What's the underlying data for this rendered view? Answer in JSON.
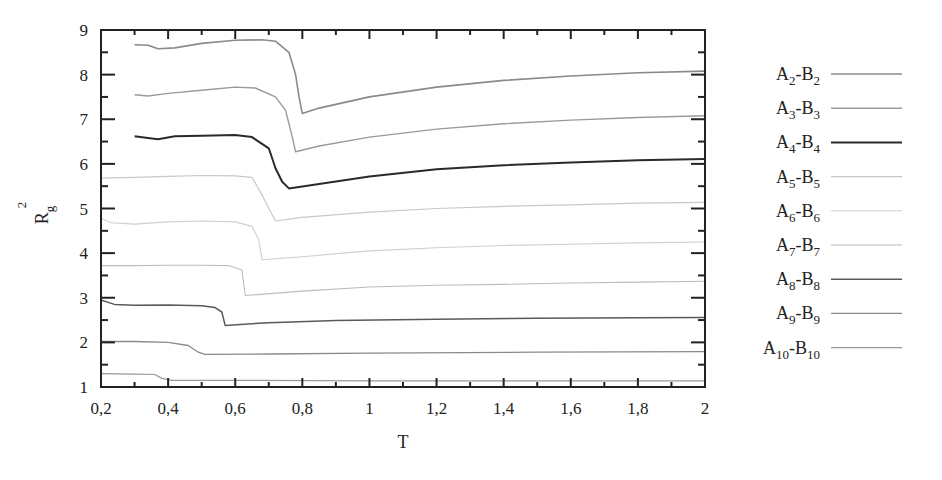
{
  "chart_data": {
    "type": "line",
    "title": "",
    "xlabel": "T",
    "ylabel": "R_g^2",
    "xlim": [
      0.2,
      2.0
    ],
    "ylim": [
      1,
      9
    ],
    "x_ticks": [
      "0,2",
      "0,4",
      "0,6",
      "0,8",
      "1",
      "1,2",
      "1,4",
      "1,6",
      "1,8",
      "2"
    ],
    "y_ticks": [
      "1",
      "2",
      "3",
      "4",
      "5",
      "6",
      "7",
      "8",
      "9"
    ],
    "grid": false,
    "legend_position": "right-outside",
    "series": [
      {
        "name": "A2-B2",
        "label_main": [
          "A",
          "2",
          "-B",
          "2"
        ],
        "color": "#8a8a8a",
        "width": 1.6,
        "points": [
          [
            0.3,
            8.67
          ],
          [
            0.34,
            8.66
          ],
          [
            0.37,
            8.58
          ],
          [
            0.42,
            8.6
          ],
          [
            0.5,
            8.7
          ],
          [
            0.6,
            8.77
          ],
          [
            0.68,
            8.78
          ],
          [
            0.72,
            8.75
          ],
          [
            0.76,
            8.5
          ],
          [
            0.78,
            8.0
          ],
          [
            0.79,
            7.5
          ],
          [
            0.8,
            7.13
          ],
          [
            0.85,
            7.25
          ],
          [
            1.0,
            7.5
          ],
          [
            1.2,
            7.72
          ],
          [
            1.4,
            7.87
          ],
          [
            1.6,
            7.97
          ],
          [
            1.8,
            8.04
          ],
          [
            2.0,
            8.08
          ]
        ]
      },
      {
        "name": "A3-B3",
        "label_main": [
          "A",
          "3",
          "-B",
          "3"
        ],
        "color": "#9a9a9a",
        "width": 1.4,
        "points": [
          [
            0.3,
            7.55
          ],
          [
            0.34,
            7.52
          ],
          [
            0.4,
            7.58
          ],
          [
            0.5,
            7.65
          ],
          [
            0.6,
            7.72
          ],
          [
            0.66,
            7.7
          ],
          [
            0.72,
            7.5
          ],
          [
            0.75,
            7.2
          ],
          [
            0.77,
            6.6
          ],
          [
            0.78,
            6.27
          ],
          [
            0.85,
            6.4
          ],
          [
            1.0,
            6.6
          ],
          [
            1.2,
            6.78
          ],
          [
            1.4,
            6.9
          ],
          [
            1.6,
            6.98
          ],
          [
            1.8,
            7.04
          ],
          [
            2.0,
            7.08
          ]
        ]
      },
      {
        "name": "A4-B4",
        "label_main": [
          "A",
          "4",
          "-B",
          "4"
        ],
        "color": "#2a2a2a",
        "width": 2.0,
        "points": [
          [
            0.3,
            6.62
          ],
          [
            0.34,
            6.58
          ],
          [
            0.37,
            6.55
          ],
          [
            0.42,
            6.62
          ],
          [
            0.5,
            6.63
          ],
          [
            0.6,
            6.65
          ],
          [
            0.65,
            6.6
          ],
          [
            0.7,
            6.35
          ],
          [
            0.72,
            5.9
          ],
          [
            0.74,
            5.6
          ],
          [
            0.76,
            5.45
          ],
          [
            0.85,
            5.55
          ],
          [
            1.0,
            5.72
          ],
          [
            1.2,
            5.88
          ],
          [
            1.4,
            5.97
          ],
          [
            1.6,
            6.03
          ],
          [
            1.8,
            6.08
          ],
          [
            2.0,
            6.11
          ]
        ]
      },
      {
        "name": "A5-B5",
        "label_main": [
          "A",
          "5",
          "-B",
          "5"
        ],
        "color": "#c8c8c8",
        "width": 1.2,
        "points": [
          [
            0.2,
            5.68
          ],
          [
            0.3,
            5.7
          ],
          [
            0.4,
            5.72
          ],
          [
            0.5,
            5.74
          ],
          [
            0.6,
            5.73
          ],
          [
            0.65,
            5.7
          ],
          [
            0.68,
            5.3
          ],
          [
            0.7,
            5.0
          ],
          [
            0.72,
            4.72
          ],
          [
            0.8,
            4.8
          ],
          [
            1.0,
            4.92
          ],
          [
            1.2,
            5.0
          ],
          [
            1.4,
            5.05
          ],
          [
            1.6,
            5.08
          ],
          [
            1.8,
            5.12
          ],
          [
            2.0,
            5.14
          ]
        ]
      },
      {
        "name": "A6-B6",
        "label_main": [
          "A",
          "6",
          "-B",
          "6"
        ],
        "color": "#cfcfcf",
        "width": 1.1,
        "points": [
          [
            0.2,
            4.78
          ],
          [
            0.23,
            4.68
          ],
          [
            0.3,
            4.65
          ],
          [
            0.4,
            4.7
          ],
          [
            0.5,
            4.72
          ],
          [
            0.6,
            4.7
          ],
          [
            0.65,
            4.6
          ],
          [
            0.67,
            4.3
          ],
          [
            0.68,
            3.85
          ],
          [
            0.8,
            3.92
          ],
          [
            1.0,
            4.05
          ],
          [
            1.2,
            4.12
          ],
          [
            1.4,
            4.17
          ],
          [
            1.6,
            4.2
          ],
          [
            1.8,
            4.23
          ],
          [
            2.0,
            4.25
          ]
        ]
      },
      {
        "name": "A7-B7",
        "label_main": [
          "A",
          "7",
          "-B",
          "7"
        ],
        "color": "#bdbdbd",
        "width": 1.1,
        "points": [
          [
            0.2,
            3.72
          ],
          [
            0.3,
            3.72
          ],
          [
            0.4,
            3.73
          ],
          [
            0.5,
            3.73
          ],
          [
            0.58,
            3.72
          ],
          [
            0.62,
            3.62
          ],
          [
            0.63,
            3.05
          ],
          [
            0.8,
            3.15
          ],
          [
            1.0,
            3.24
          ],
          [
            1.2,
            3.28
          ],
          [
            1.4,
            3.3
          ],
          [
            1.6,
            3.33
          ],
          [
            1.8,
            3.35
          ],
          [
            2.0,
            3.37
          ]
        ]
      },
      {
        "name": "A8-B8",
        "label_main": [
          "A",
          "8",
          "-B",
          "8"
        ],
        "color": "#5a5a5a",
        "width": 1.5,
        "points": [
          [
            0.2,
            2.95
          ],
          [
            0.24,
            2.85
          ],
          [
            0.3,
            2.83
          ],
          [
            0.4,
            2.84
          ],
          [
            0.5,
            2.82
          ],
          [
            0.54,
            2.78
          ],
          [
            0.56,
            2.68
          ],
          [
            0.57,
            2.38
          ],
          [
            0.7,
            2.44
          ],
          [
            0.9,
            2.49
          ],
          [
            1.2,
            2.52
          ],
          [
            1.5,
            2.54
          ],
          [
            1.8,
            2.55
          ],
          [
            2.0,
            2.56
          ]
        ]
      },
      {
        "name": "A9-B9",
        "label_main": [
          "A",
          "9",
          "-B",
          "9"
        ],
        "color": "#8a8a8a",
        "width": 1.3,
        "points": [
          [
            0.2,
            2.02
          ],
          [
            0.3,
            2.02
          ],
          [
            0.4,
            2.0
          ],
          [
            0.46,
            1.93
          ],
          [
            0.49,
            1.78
          ],
          [
            0.51,
            1.73
          ],
          [
            0.7,
            1.74
          ],
          [
            1.0,
            1.76
          ],
          [
            1.5,
            1.78
          ],
          [
            2.0,
            1.79
          ]
        ]
      },
      {
        "name": "A10-B10",
        "label_main": [
          "A",
          "10",
          "-B",
          "10"
        ],
        "color": "#9a9a9a",
        "width": 1.2,
        "points": [
          [
            0.2,
            1.3
          ],
          [
            0.3,
            1.29
          ],
          [
            0.36,
            1.28
          ],
          [
            0.38,
            1.2
          ],
          [
            0.41,
            1.15
          ],
          [
            0.6,
            1.15
          ],
          [
            1.0,
            1.14
          ],
          [
            1.5,
            1.14
          ],
          [
            2.0,
            1.14
          ]
        ]
      }
    ]
  },
  "axes": {
    "xlabel": "T",
    "ylabel_base": "R",
    "ylabel_sub": "g",
    "ylabel_sup": "2"
  }
}
